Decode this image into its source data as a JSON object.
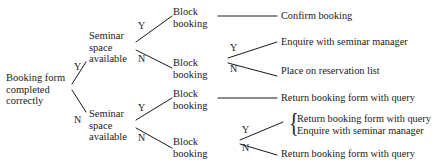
{
  "diagram": {
    "type": "decision-tree",
    "line_color": "#1a1a1a",
    "background_color": "#ffffff",
    "nodes": {
      "root": "Booking form\ncompleted\ncorrectly",
      "seminar_top": "Seminar\nspace\navailable",
      "seminar_bottom": "Seminar\nspace\navailable",
      "block_1": "Block\nbooking",
      "block_2": "Block\nbooking",
      "block_3": "Block\nbooking",
      "block_4": "Block\nbooking"
    },
    "outcomes": {
      "confirm_booking": "Confirm booking",
      "enquire_manager_top": "Enquire with seminar manager",
      "reservation_list": "Place on reservation list",
      "return_query_1": "Return booking form with query",
      "return_query_2": "Return booking form with query",
      "enquire_manager_bottom": "Enquire with seminar manager",
      "return_query_3": "Return booking form with query"
    },
    "edge_labels": {
      "root_yes": "Y",
      "root_no": "N",
      "seminar_top_yes": "Y",
      "seminar_top_no": "N",
      "seminar_bottom_yes": "Y",
      "seminar_bottom_no": "N",
      "block_2_yes": "Y",
      "block_2_no": "N",
      "block_4_yes": "Y",
      "block_4_no": "N"
    },
    "brace": "{"
  }
}
